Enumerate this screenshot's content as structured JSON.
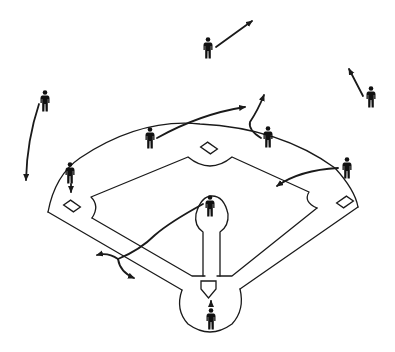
{
  "diagram": {
    "colors": {
      "lines": "#1a1a1a",
      "players": "#111111",
      "background": "#ffffff"
    },
    "players": [
      {
        "id": "pitcher",
        "role": "Pitcher"
      },
      {
        "id": "catcher",
        "role": "Catcher"
      },
      {
        "id": "first-baseman",
        "role": "First Baseman"
      },
      {
        "id": "second-baseman",
        "role": "Second Baseman"
      },
      {
        "id": "shortstop",
        "role": "Shortstop"
      },
      {
        "id": "third-baseman",
        "role": "Third Baseman"
      },
      {
        "id": "left-fielder",
        "role": "Left Fielder"
      },
      {
        "id": "center-fielder",
        "role": "Center Fielder"
      },
      {
        "id": "right-fielder",
        "role": "Right Fielder"
      }
    ],
    "bases": [
      "home-plate",
      "first-base",
      "second-base",
      "third-base"
    ],
    "movement_arrows": 9
  }
}
